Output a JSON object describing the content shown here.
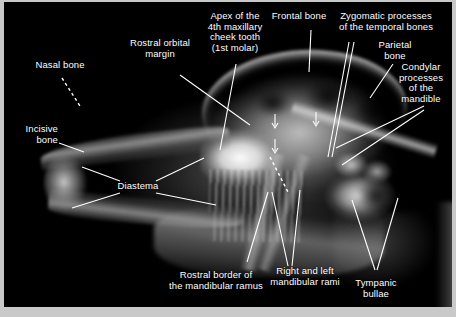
{
  "figure": {
    "type": "annotated-lateral-skull-radiograph",
    "background_color": "#000000",
    "frame_color": "#c9c9c9",
    "label_color": "#ffffff",
    "leader_color": "#ffffff"
  },
  "labels": {
    "nasal_bone": "Nasal bone",
    "incisive_bone": "Incisive\nbone",
    "rostral_orbital_margin": "Rostral orbital\nmargin",
    "apex_4th_cheek_tooth": "Apex of the\n4th maxillary\ncheek tooth\n(1st molar)",
    "frontal_bone": "Frontal bone",
    "zygomatic_processes": "Zygomatic processes\nof the temporal bones",
    "parietal_bone": "Parietal\nbone",
    "condylar_processes": "Condylar\nprocesses\nof the\nmandible",
    "diastema": "Diastema",
    "rostral_border_mandibular_ramus": "Rostral border of\nthe mandibular ramus",
    "right_and_left_mandibular_rami": "Right and left\nmandibular rami",
    "tympanic_bullae": "Tympanic\nbullae"
  }
}
